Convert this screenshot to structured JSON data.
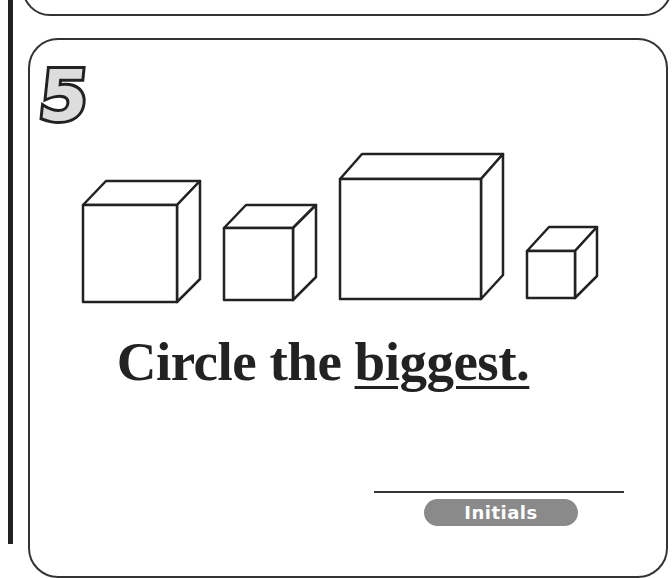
{
  "worksheet": {
    "problem_number": "5",
    "instruction_prefix": "Circle the ",
    "instruction_emphasis": "biggest.",
    "initials_label": "Initials",
    "cubes": [
      {
        "name": "cube-1",
        "size": "large"
      },
      {
        "name": "cube-2",
        "size": "medium"
      },
      {
        "name": "cube-3",
        "size": "largest"
      },
      {
        "name": "cube-4",
        "size": "small"
      }
    ]
  }
}
